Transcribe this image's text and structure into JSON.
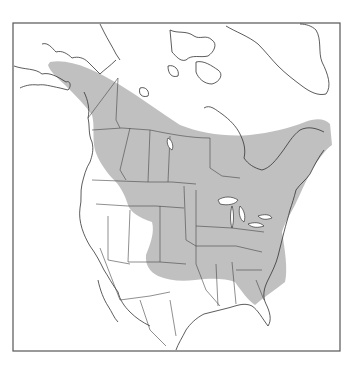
{
  "map": {
    "title": "",
    "region": "North America",
    "type": "species range map",
    "colors": {
      "range_fill": "#bdbdbd",
      "outline": "#333333",
      "background": "#ffffff",
      "frame": "#555555"
    },
    "layers": [
      {
        "name": "frame"
      },
      {
        "name": "range-shading",
        "description": "gray shaded distribution range from Alaska across boreal Canada to the eastern United States"
      },
      {
        "name": "coastlines"
      },
      {
        "name": "political-borders"
      },
      {
        "name": "great-lakes"
      }
    ]
  }
}
